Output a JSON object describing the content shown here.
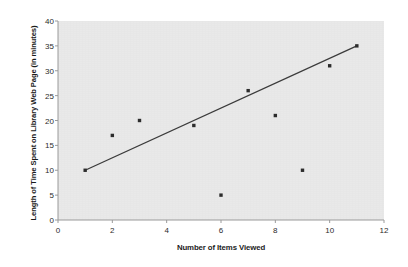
{
  "chart_data": {
    "type": "scatter",
    "title": "",
    "xlabel": "Number of Items Viewed",
    "ylabel": "Length of Time Spent on Library Web Page (in minutes)",
    "xlim": [
      0,
      12
    ],
    "ylim": [
      0,
      40
    ],
    "xticks": [
      0,
      2,
      4,
      6,
      8,
      10,
      12
    ],
    "yticks": [
      0,
      5,
      10,
      15,
      20,
      25,
      30,
      35,
      40
    ],
    "xtick_labels": [
      "0",
      "2",
      "4",
      "6",
      "8",
      "10",
      "12"
    ],
    "ytick_labels": [
      "0",
      "5",
      "10",
      "15",
      "20",
      "25",
      "30",
      "35",
      "40"
    ],
    "grid": false,
    "legend": false,
    "legend_position": "none",
    "marker_color": "#2b2b2b",
    "trendline_color": "#3a3a3a",
    "plot_background": "#e9e9e9",
    "page_background": "#ffffff",
    "x": [
      1,
      2,
      3,
      5,
      6,
      7,
      8,
      9,
      10,
      11
    ],
    "y": [
      10,
      17,
      20,
      19,
      5,
      26,
      21,
      10,
      31,
      35
    ],
    "points": [
      {
        "x": 1,
        "y": 10
      },
      {
        "x": 2,
        "y": 17
      },
      {
        "x": 3,
        "y": 20
      },
      {
        "x": 5,
        "y": 19
      },
      {
        "x": 6,
        "y": 5
      },
      {
        "x": 7,
        "y": 26
      },
      {
        "x": 8,
        "y": 21
      },
      {
        "x": 9,
        "y": 10
      },
      {
        "x": 10,
        "y": 31
      },
      {
        "x": 11,
        "y": 35
      }
    ],
    "trendline": {
      "x_start": 1,
      "y_start": 10,
      "x_end": 11,
      "y_end": 35
    }
  }
}
